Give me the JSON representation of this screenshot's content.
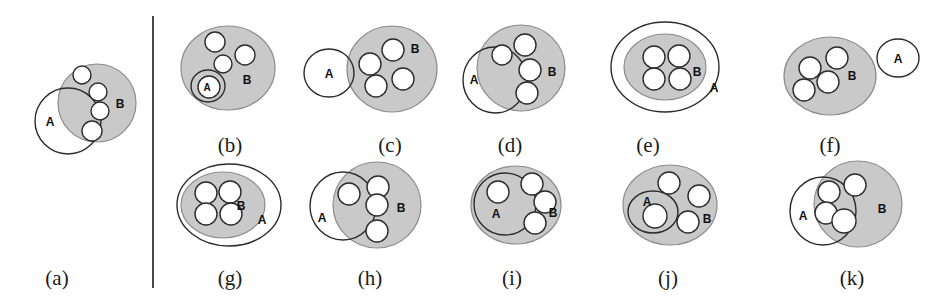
{
  "figure": {
    "title": "",
    "background_color": "#ffffff",
    "width": 946,
    "height": 305,
    "region_b_fill": "#c9c9c9",
    "region_b_stroke": "#8c8c8c",
    "region_a_fill": "none",
    "outline_color": "#2b2b2b",
    "item_fill": "#ffffff",
    "item_stroke": "#2b2b2b",
    "divider": {
      "name": "vertical-divider",
      "x": 153,
      "y1": 16,
      "y2": 288,
      "color": "#4a4a4a",
      "width": 2
    }
  },
  "labels": {
    "set_a": "A",
    "set_b": "B"
  },
  "panels": [
    {
      "id": "a",
      "caption": "(a)",
      "caption_x": 57,
      "caption_y": 285,
      "description": "A partially overlaps B; items straddle the A boundary",
      "region_b": {
        "cx": 97,
        "cy": 103,
        "rx": 39,
        "ry": 39,
        "label_x": 120,
        "label_y": 104,
        "label_size": "normal"
      },
      "region_a": {
        "cx": 68,
        "cy": 121,
        "rx": 33,
        "ry": 33,
        "label_x": 50,
        "label_y": 122,
        "label_size": "normal"
      },
      "items": [
        {
          "cx": 82,
          "cy": 75,
          "r": 9
        },
        {
          "cx": 98,
          "cy": 92,
          "r": 9
        },
        {
          "cx": 100,
          "cy": 111,
          "r": 9
        },
        {
          "cx": 92,
          "cy": 131,
          "r": 10
        }
      ]
    },
    {
      "id": "b",
      "caption": "(b)",
      "caption_x": 230,
      "caption_y": 152,
      "description": "A inside B, containing one item; three items in B outside A",
      "region_b": {
        "cx": 228,
        "cy": 68,
        "rx": 47,
        "ry": 42,
        "label_x": 247,
        "label_y": 80,
        "label_size": "normal"
      },
      "region_a": {
        "cx": 208,
        "cy": 86,
        "rx": 17,
        "ry": 16,
        "label_x": 207,
        "label_y": 87,
        "label_size": "small"
      },
      "items": [
        {
          "cx": 215,
          "cy": 42,
          "r": 10
        },
        {
          "cx": 245,
          "cy": 55,
          "r": 10
        },
        {
          "cx": 223,
          "cy": 64,
          "r": 9
        },
        {
          "cx": 209,
          "cy": 87,
          "r": 11
        }
      ]
    },
    {
      "id": "c",
      "caption": "(c)",
      "caption_x": 390,
      "caption_y": 152,
      "description": "A disjoint from B; four items inside B",
      "region_b": {
        "cx": 392,
        "cy": 69,
        "rx": 45,
        "ry": 43,
        "label_x": 415,
        "label_y": 49,
        "label_size": "normal"
      },
      "region_a": {
        "cx": 329,
        "cy": 73,
        "rx": 25,
        "ry": 24,
        "label_x": 329,
        "label_y": 74,
        "label_size": "normal"
      },
      "items": [
        {
          "cx": 393,
          "cy": 50,
          "r": 11
        },
        {
          "cx": 370,
          "cy": 64,
          "r": 11
        },
        {
          "cx": 376,
          "cy": 86,
          "r": 11
        },
        {
          "cx": 403,
          "cy": 79,
          "r": 11
        }
      ]
    },
    {
      "id": "d",
      "caption": "(d)",
      "caption_x": 510,
      "caption_y": 152,
      "description": "A overlaps B; items straddle the A boundary",
      "region_b": {
        "cx": 521,
        "cy": 68,
        "rx": 44,
        "ry": 43,
        "label_x": 552,
        "label_y": 72,
        "label_size": "normal"
      },
      "region_a": {
        "cx": 495,
        "cy": 80,
        "rx": 32,
        "ry": 33,
        "label_x": 474,
        "label_y": 80,
        "label_size": "normal"
      },
      "items": [
        {
          "cx": 502,
          "cy": 55,
          "r": 10
        },
        {
          "cx": 525,
          "cy": 45,
          "r": 11
        },
        {
          "cx": 530,
          "cy": 70,
          "r": 11
        },
        {
          "cx": 527,
          "cy": 93,
          "r": 11
        }
      ]
    },
    {
      "id": "e",
      "caption": "(e)",
      "caption_x": 648,
      "caption_y": 152,
      "description": "B nested inside A; four items inside B",
      "region_b": {
        "cx": 665,
        "cy": 67,
        "rx": 41,
        "ry": 33,
        "label_x": 697,
        "label_y": 72,
        "label_size": "normal"
      },
      "region_a": {
        "cx": 665,
        "cy": 67,
        "rx": 54,
        "ry": 45,
        "label_x": 714,
        "label_y": 88,
        "label_size": "normal"
      },
      "items": [
        {
          "cx": 654,
          "cy": 57,
          "r": 11
        },
        {
          "cx": 679,
          "cy": 56,
          "r": 11
        },
        {
          "cx": 654,
          "cy": 79,
          "r": 11
        },
        {
          "cx": 680,
          "cy": 79,
          "r": 11
        }
      ]
    },
    {
      "id": "f",
      "caption": "(f)",
      "caption_x": 830,
      "caption_y": 152,
      "description": "B with four items; A disjoint to the right",
      "region_b": {
        "cx": 830,
        "cy": 76,
        "rx": 46,
        "ry": 39,
        "label_x": 852,
        "label_y": 76,
        "label_size": "normal"
      },
      "region_a": {
        "cx": 898,
        "cy": 58,
        "rx": 21,
        "ry": 19,
        "label_x": 898,
        "label_y": 59,
        "label_size": "normal"
      },
      "items": [
        {
          "cx": 837,
          "cy": 58,
          "r": 11
        },
        {
          "cx": 810,
          "cy": 68,
          "r": 11
        },
        {
          "cx": 828,
          "cy": 82,
          "r": 11
        },
        {
          "cx": 804,
          "cy": 90,
          "r": 11
        }
      ]
    },
    {
      "id": "g",
      "caption": "(g)",
      "caption_x": 230,
      "caption_y": 285,
      "description": "B nested inside A, offset; four items inside B",
      "region_b": {
        "cx": 223,
        "cy": 205,
        "rx": 42,
        "ry": 33,
        "label_x": 241,
        "label_y": 206,
        "label_size": "normal"
      },
      "region_a": {
        "cx": 229,
        "cy": 205,
        "rx": 52,
        "ry": 41,
        "label_x": 262,
        "label_y": 220,
        "label_size": "normal"
      },
      "items": [
        {
          "cx": 206,
          "cy": 193,
          "r": 11
        },
        {
          "cx": 230,
          "cy": 192,
          "r": 11
        },
        {
          "cx": 206,
          "cy": 214,
          "r": 11
        },
        {
          "cx": 231,
          "cy": 214,
          "r": 11
        }
      ]
    },
    {
      "id": "h",
      "caption": "(h)",
      "caption_x": 370,
      "caption_y": 285,
      "description": "A overlaps B; one item in A only region, one straddling, two in B only",
      "region_b": {
        "cx": 377,
        "cy": 205,
        "rx": 44,
        "ry": 43,
        "label_x": 401,
        "label_y": 208,
        "label_size": "normal"
      },
      "region_a": {
        "cx": 343,
        "cy": 206,
        "rx": 33,
        "ry": 34,
        "label_x": 322,
        "label_y": 218,
        "label_size": "normal"
      },
      "items": [
        {
          "cx": 349,
          "cy": 194,
          "r": 11
        },
        {
          "cx": 378,
          "cy": 187,
          "r": 11
        },
        {
          "cx": 377,
          "cy": 205,
          "r": 11
        },
        {
          "cx": 377,
          "cy": 231,
          "r": 11
        }
      ]
    },
    {
      "id": "i",
      "caption": "(i)",
      "caption_x": 512,
      "caption_y": 285,
      "description": "A large circle inside B containing one item; three items in B outside A",
      "region_b": {
        "cx": 516,
        "cy": 205,
        "rx": 45,
        "ry": 39,
        "label_x": 553,
        "label_y": 213,
        "label_size": "normal"
      },
      "region_a": {
        "cx": 505,
        "cy": 204,
        "rx": 31,
        "ry": 31,
        "label_x": 496,
        "label_y": 214,
        "label_size": "normal"
      },
      "items": [
        {
          "cx": 498,
          "cy": 192,
          "r": 11
        },
        {
          "cx": 532,
          "cy": 184,
          "r": 11
        },
        {
          "cx": 545,
          "cy": 202,
          "r": 11
        },
        {
          "cx": 535,
          "cy": 223,
          "r": 11
        }
      ]
    },
    {
      "id": "j",
      "caption": "(j)",
      "caption_x": 668,
      "caption_y": 285,
      "description": "A small ellipse inside B containing one item; three items in B outside A",
      "region_b": {
        "cx": 670,
        "cy": 205,
        "rx": 47,
        "ry": 40,
        "label_x": 707,
        "label_y": 219,
        "label_size": "normal"
      },
      "region_a": {
        "cx": 653,
        "cy": 212,
        "rx": 25,
        "ry": 21,
        "label_x": 647,
        "label_y": 202,
        "label_size": "normal"
      },
      "items": [
        {
          "cx": 669,
          "cy": 183,
          "r": 11
        },
        {
          "cx": 699,
          "cy": 196,
          "r": 11
        },
        {
          "cx": 655,
          "cy": 216,
          "r": 12
        },
        {
          "cx": 688,
          "cy": 222,
          "r": 11
        }
      ]
    },
    {
      "id": "k",
      "caption": "(k)",
      "caption_x": 852,
      "caption_y": 285,
      "description": "A overlaps B; three items inside the intersection",
      "region_b": {
        "cx": 858,
        "cy": 204,
        "rx": 44,
        "ry": 43,
        "label_x": 882,
        "label_y": 209,
        "label_size": "normal"
      },
      "region_a": {
        "cx": 823,
        "cy": 211,
        "rx": 33,
        "ry": 34,
        "label_x": 803,
        "label_y": 216,
        "label_size": "normal"
      },
      "items": [
        {
          "cx": 829,
          "cy": 192,
          "r": 11
        },
        {
          "cx": 855,
          "cy": 185,
          "r": 11
        },
        {
          "cx": 826,
          "cy": 213,
          "r": 11
        },
        {
          "cx": 844,
          "cy": 221,
          "r": 12
        }
      ]
    }
  ]
}
